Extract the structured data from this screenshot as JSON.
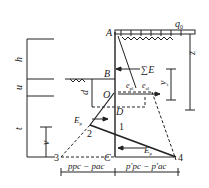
{
  "diagram": {
    "type": "sheet-pile-earth-pressure",
    "labels": {
      "load": "q",
      "load_sub": "0",
      "point_A": "A",
      "point_B": "B",
      "point_O": "O",
      "point_D": "D",
      "point_C": "C",
      "point_1": "1",
      "point_2": "2",
      "point_3": "3",
      "point_4": "4",
      "sum_E": "∑E",
      "e_pl": "e",
      "e_pl_sub": "pl",
      "e_al": "e",
      "e_al_sub": "al",
      "Ep": "E",
      "Ep_sub": "p",
      "Ep_prime": "E",
      "Ep_prime_sub": "p",
      "Ep_prime_mark": "′",
      "dim_h": "h",
      "dim_u": "u",
      "dim_t": "t",
      "dim_v": "v",
      "dim_d": "d",
      "dim_y": "y",
      "dim_z": "z",
      "bottom_left": "p",
      "bottom_left_full": "ppc − pac",
      "bottom_right_full": "p′pc − p′ac"
    },
    "colors": {
      "line": "#222222",
      "background": "#ffffff"
    }
  }
}
